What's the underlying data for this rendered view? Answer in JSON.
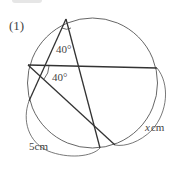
{
  "problem_number": "(1)",
  "labels": {
    "angle_top": "40°",
    "angle_left": "40°",
    "arc_left": "5cm",
    "arc_right_var": "x",
    "arc_right_unit": "cm"
  },
  "colors": {
    "stroke": "#333333",
    "circle": "#555555",
    "text": "#444444"
  }
}
